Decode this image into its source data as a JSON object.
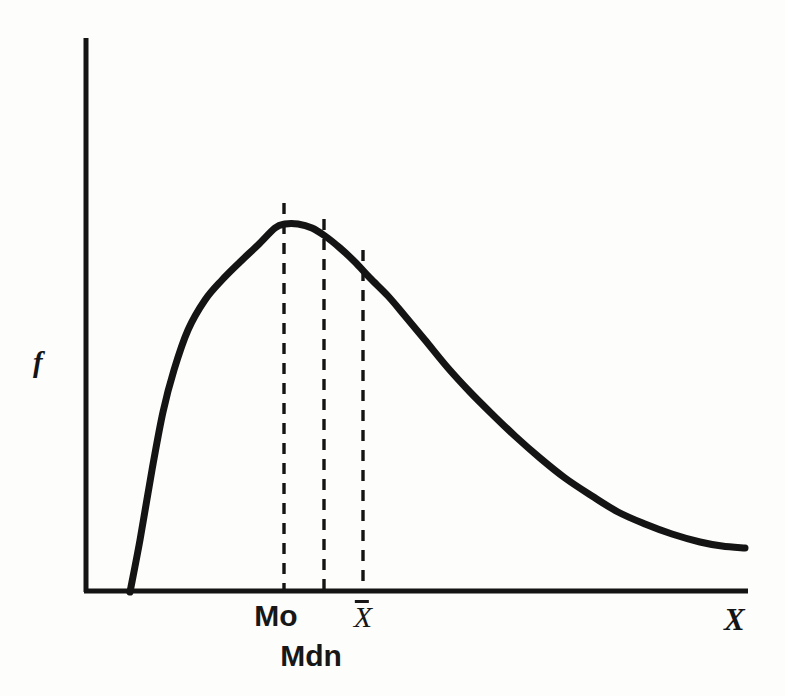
{
  "figure": {
    "background_color": "#fdfdfb",
    "ink_color": "#141414",
    "axis": {
      "y_label": "f",
      "x_label": "X",
      "y_axis_top_px": 38,
      "origin_px": [
        85,
        592
      ],
      "x_axis_right_px": 748,
      "line_width_px": 5
    },
    "marker_labels": {
      "mode": "Mo",
      "median": "Mdn",
      "mean": "X̄"
    }
  },
  "chart_data": {
    "type": "line",
    "title": "",
    "subtitle": "",
    "xlabel": "X",
    "ylabel": "f",
    "grid": false,
    "legend": null,
    "axis_ticks": {
      "x": [
        "Mo",
        "Mdn",
        "X̄"
      ],
      "y": []
    },
    "distribution": "positively skewed (right-skewed) frequency distribution",
    "ordering_note": "Mo < Mdn < X̄",
    "series": [
      {
        "name": "frequency curve",
        "x": [
          130,
          140,
          152,
          163,
          174,
          188,
          205,
          222,
          240,
          258,
          275,
          285,
          298,
          312,
          325,
          340,
          355,
          370,
          388,
          405,
          425,
          448,
          470,
          492,
          515,
          540,
          565,
          592,
          618,
          645,
          672,
          700,
          722,
          745
        ],
        "y": [
          592,
          540,
          470,
          412,
          370,
          330,
          300,
          280,
          262,
          245,
          228,
          224,
          224,
          228,
          236,
          248,
          262,
          278,
          296,
          316,
          340,
          368,
          392,
          414,
          436,
          458,
          478,
          496,
          512,
          524,
          534,
          542,
          546,
          548
        ]
      }
    ],
    "reference_lines": [
      {
        "label": "Mo",
        "description": "mode — dashed vertical at curve peak",
        "x_px": 284,
        "top_px": 203,
        "bottom_px": 590,
        "style": "dashed"
      },
      {
        "label": "Mdn",
        "description": "median — dashed vertical right of mode",
        "x_px": 324,
        "top_px": 219,
        "bottom_px": 590,
        "style": "dashed"
      },
      {
        "label": "X̄",
        "description": "mean — dashed vertical right of median",
        "x_px": 363,
        "top_px": 250,
        "bottom_px": 590,
        "style": "dashed"
      }
    ],
    "annotations": [
      {
        "text": "Mo",
        "x_px": 276,
        "y_px": 628,
        "role": "mode-tick-label"
      },
      {
        "text": "X̄",
        "x_px": 363,
        "y_px": 627,
        "role": "mean-tick-label"
      },
      {
        "text": "Mdn",
        "x_px": 311,
        "y_px": 668,
        "role": "median-tick-label"
      },
      {
        "text": "f",
        "x_px": 42,
        "y_px": 370,
        "role": "y-axis-label"
      },
      {
        "text": "X",
        "x_px": 735,
        "y_px": 630,
        "role": "x-axis-label"
      }
    ]
  }
}
